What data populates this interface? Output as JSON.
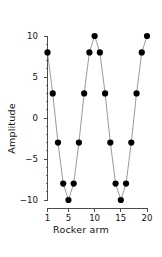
{
  "chart_data": {
    "type": "line",
    "title": "",
    "xlabel": "Rocker arm",
    "ylabel": "Amplitude",
    "x": [
      1,
      2,
      3,
      4,
      5,
      6,
      7,
      8,
      9,
      10,
      11,
      12,
      13,
      14,
      15,
      16,
      17,
      18,
      19,
      20
    ],
    "values": [
      8,
      3,
      -3,
      -8,
      -10,
      -8,
      -3,
      3,
      8,
      10,
      8,
      3,
      -3,
      -8,
      -10,
      -8,
      -3,
      3,
      8,
      10
    ],
    "series": [
      {
        "name": "Amplitude",
        "values": [
          8,
          3,
          -3,
          -8,
          -10,
          -8,
          -3,
          3,
          8,
          10,
          8,
          3,
          -3,
          -8,
          -10,
          -8,
          -3,
          3,
          8,
          10
        ]
      }
    ],
    "xlim": [
      1,
      20
    ],
    "ylim": [
      -10,
      10
    ],
    "xticks": [
      1,
      5,
      10,
      15,
      20
    ],
    "xtick_labels": [
      "1",
      "5",
      "10",
      "15",
      "20"
    ],
    "yticks": [
      -10,
      -5,
      0,
      5,
      10
    ],
    "ytick_labels": [
      "-10",
      "-5",
      "0",
      "5",
      "10"
    ],
    "y_minor_ticks": [
      -9,
      -8,
      -7,
      -6,
      -4,
      -3,
      -2,
      -1,
      1,
      2,
      3,
      4,
      6,
      7,
      8,
      9
    ],
    "grid": false,
    "legend": null,
    "marker": "circle",
    "marker_color": "#000000",
    "line_color": "#888888",
    "axis_color": "#4d4d4d",
    "background": "#ffffff"
  }
}
